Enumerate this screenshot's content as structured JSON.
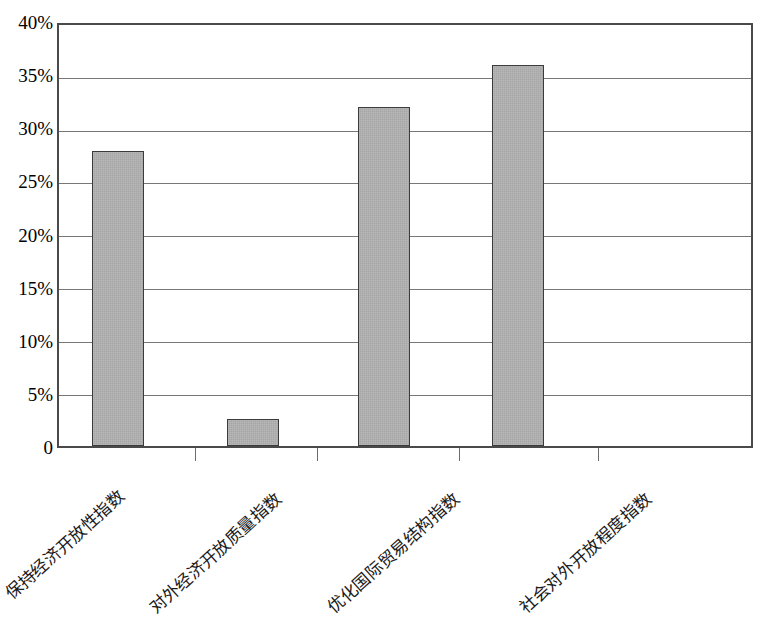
{
  "chart_data": {
    "type": "bar",
    "title": "",
    "subtitle": "",
    "xlabel": "",
    "ylabel": "",
    "categories": [
      "保持经济开放性指数",
      "对外经济开放质量指数",
      "优化国际贸易结构指数",
      "社会对外开放程度指数"
    ],
    "values": [
      27.8,
      2.5,
      31.9,
      35.9
    ],
    "value_unit": "%",
    "ylim": [
      0,
      40
    ],
    "ytick_values": [
      40,
      35,
      30,
      25,
      20,
      15,
      10,
      5,
      0
    ],
    "ytick_labels": [
      "40%",
      "35%",
      "30%",
      "25%",
      "20%",
      "15%",
      "10%",
      "5%",
      "0"
    ],
    "grid": true,
    "grid_axis": "y",
    "legend": false,
    "legend_position": "none",
    "bar_fill_color": "#a6a6a6",
    "bar_border_color": "#3b3b3b",
    "axis_color": "#4a4a4a",
    "background_color": "#ffffff",
    "xlabel_rotation_deg": -42,
    "series": [
      {
        "name": "",
        "values": [
          27.8,
          2.5,
          31.9,
          35.9
        ]
      }
    ]
  }
}
